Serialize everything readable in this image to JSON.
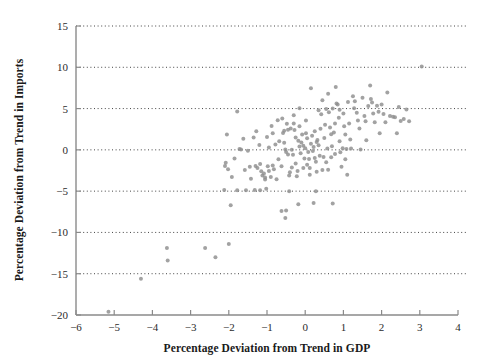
{
  "chart_data": {
    "type": "scatter",
    "title": "",
    "xlabel": "Percentage Deviation from Trend in GDP",
    "ylabel": "Percentage Deviation from Trend in Imports",
    "xlim": [
      -6,
      4
    ],
    "ylim": [
      -20,
      15
    ],
    "xticks": [
      -6,
      -5,
      -4,
      -3,
      -2,
      -1,
      0,
      1,
      2,
      3,
      4
    ],
    "xticklabels": [
      "−6",
      "−5",
      "−4",
      "−3",
      "−2",
      "−1",
      "0",
      "1",
      "2",
      "3",
      "4"
    ],
    "yticks": [
      -20,
      -15,
      -10,
      -5,
      0,
      5,
      10,
      15
    ],
    "yticklabels": [
      "−20",
      "−15",
      "−10",
      "−5",
      "0",
      "5",
      "10",
      "15"
    ],
    "grid": "horizontal-dotted",
    "legend": "none",
    "marker": {
      "shape": "circle",
      "size_px": 3.0,
      "color": "#8e8e8e"
    },
    "series": [
      {
        "name": "GDP vs Imports deviation",
        "points": [
          [
            -5.15,
            -19.6
          ],
          [
            -4.3,
            -15.6
          ],
          [
            -3.62,
            -11.9
          ],
          [
            -3.6,
            -13.4
          ],
          [
            -2.62,
            -11.9
          ],
          [
            -2.35,
            -13.0
          ],
          [
            -2.0,
            -11.4
          ],
          [
            -1.95,
            -6.7
          ],
          [
            -1.78,
            -4.9
          ],
          [
            -2.12,
            -4.85
          ],
          [
            -1.55,
            -4.9
          ],
          [
            -1.32,
            -4.85
          ],
          [
            -1.18,
            -4.9
          ],
          [
            -0.52,
            -8.25
          ],
          [
            -0.62,
            -7.4
          ],
          [
            -0.5,
            -7.35
          ],
          [
            -0.18,
            -6.6
          ],
          [
            0.22,
            -6.45
          ],
          [
            0.72,
            -6.5
          ],
          [
            0.28,
            -5.0
          ],
          [
            -0.42,
            -5.0
          ],
          [
            -1.02,
            -4.7
          ],
          [
            -2.05,
            1.85
          ],
          [
            -2.08,
            -1.55
          ],
          [
            -2.1,
            -1.95
          ],
          [
            -2.02,
            -2.35
          ],
          [
            -1.92,
            -3.3
          ],
          [
            -1.78,
            4.65
          ],
          [
            -1.72,
            0.1
          ],
          [
            -1.68,
            0.05
          ],
          [
            -1.62,
            1.35
          ],
          [
            -1.58,
            -2.45
          ],
          [
            -1.45,
            -2.05
          ],
          [
            -1.35,
            1.5
          ],
          [
            -1.3,
            -1.95
          ],
          [
            -1.28,
            2.25
          ],
          [
            -1.2,
            0.6
          ],
          [
            -1.18,
            -1.7
          ],
          [
            -1.15,
            -2.6
          ],
          [
            -1.12,
            -3.1
          ],
          [
            -1.08,
            -2.85
          ],
          [
            -1.05,
            -3.35
          ],
          [
            -1.0,
            1.55
          ],
          [
            -0.98,
            -2.0
          ],
          [
            -0.95,
            -2.55
          ],
          [
            -0.9,
            -3.3
          ],
          [
            -0.88,
            2.9
          ],
          [
            -0.85,
            -1.9
          ],
          [
            -0.82,
            -2.35
          ],
          [
            -0.78,
            0.65
          ],
          [
            -0.75,
            -3.55
          ],
          [
            -0.72,
            3.6
          ],
          [
            -0.68,
            1.05
          ],
          [
            -0.62,
            -2.0
          ],
          [
            -0.58,
            2.05
          ],
          [
            -0.55,
            2.3
          ],
          [
            -0.52,
            0.05
          ],
          [
            -0.5,
            -0.25
          ],
          [
            -0.48,
            3.15
          ],
          [
            -0.45,
            2.45
          ],
          [
            -0.42,
            -3.1
          ],
          [
            -0.4,
            -2.7
          ],
          [
            -0.38,
            2.6
          ],
          [
            -0.35,
            0.0
          ],
          [
            -0.32,
            -0.6
          ],
          [
            -0.3,
            3.2
          ],
          [
            -0.28,
            2.4
          ],
          [
            -0.25,
            -1.65
          ],
          [
            -0.22,
            -3.2
          ],
          [
            -0.2,
            -2.55
          ],
          [
            -0.18,
            1.1
          ],
          [
            -0.15,
            0.4
          ],
          [
            -0.12,
            -0.4
          ],
          [
            -0.1,
            0.9
          ],
          [
            -0.08,
            1.85
          ],
          [
            -0.05,
            0.5
          ],
          [
            -0.02,
            -1.05
          ],
          [
            0.0,
            0.2
          ],
          [
            0.02,
            2.0
          ],
          [
            0.05,
            1.4
          ],
          [
            0.08,
            -0.25
          ],
          [
            0.1,
            -1.1
          ],
          [
            0.12,
            -3.0
          ],
          [
            0.15,
            0.75
          ],
          [
            0.18,
            1.7
          ],
          [
            0.2,
            -0.15
          ],
          [
            0.22,
            0.35
          ],
          [
            0.25,
            2.25
          ],
          [
            0.28,
            -1.45
          ],
          [
            0.3,
            -2.65
          ],
          [
            0.32,
            1.2
          ],
          [
            0.35,
            0.55
          ],
          [
            0.38,
            -0.7
          ],
          [
            0.4,
            2.55
          ],
          [
            0.42,
            4.3
          ],
          [
            0.45,
            -2.45
          ],
          [
            0.48,
            -0.85
          ],
          [
            0.5,
            1.45
          ],
          [
            0.52,
            3.05
          ],
          [
            0.55,
            -1.5
          ],
          [
            0.58,
            0.15
          ],
          [
            0.6,
            -2.4
          ],
          [
            0.62,
            4.55
          ],
          [
            0.65,
            2.7
          ],
          [
            0.68,
            -0.9
          ],
          [
            0.7,
            0.45
          ],
          [
            0.72,
            5.0
          ],
          [
            0.75,
            2.1
          ],
          [
            0.78,
            -0.5
          ],
          [
            0.8,
            7.6
          ],
          [
            0.82,
            5.6
          ],
          [
            0.85,
            5.5
          ],
          [
            0.88,
            3.9
          ],
          [
            0.9,
            1.05
          ],
          [
            0.92,
            -0.3
          ],
          [
            0.95,
            -2.05
          ],
          [
            0.98,
            0.2
          ],
          [
            1.0,
            4.4
          ],
          [
            1.02,
            2.85
          ],
          [
            1.05,
            -1.15
          ],
          [
            1.08,
            0.1
          ],
          [
            1.1,
            -3.0
          ],
          [
            1.12,
            5.8
          ],
          [
            1.15,
            3.2
          ],
          [
            1.18,
            1.25
          ],
          [
            1.2,
            0.15
          ],
          [
            1.25,
            6.5
          ],
          [
            1.3,
            5.9
          ],
          [
            1.35,
            4.5
          ],
          [
            1.38,
            3.55
          ],
          [
            1.42,
            2.6
          ],
          [
            1.45,
            0.05
          ],
          [
            1.5,
            6.3
          ],
          [
            1.55,
            4.1
          ],
          [
            1.58,
            3.45
          ],
          [
            1.6,
            1.15
          ],
          [
            1.65,
            5.3
          ],
          [
            1.7,
            7.8
          ],
          [
            1.72,
            6.15
          ],
          [
            1.75,
            5.75
          ],
          [
            1.78,
            4.4
          ],
          [
            1.82,
            3.35
          ],
          [
            1.88,
            5.35
          ],
          [
            1.92,
            4.6
          ],
          [
            1.95,
            2.0
          ],
          [
            2.0,
            5.5
          ],
          [
            2.05,
            4.35
          ],
          [
            2.1,
            3.35
          ],
          [
            2.15,
            6.95
          ],
          [
            2.22,
            4.1
          ],
          [
            2.3,
            4.0
          ],
          [
            2.35,
            3.95
          ],
          [
            2.4,
            2.0
          ],
          [
            2.45,
            5.2
          ],
          [
            2.5,
            3.5
          ],
          [
            2.58,
            3.75
          ],
          [
            2.65,
            4.9
          ],
          [
            2.72,
            3.45
          ],
          [
            3.05,
            10.1
          ],
          [
            -0.6,
            3.8
          ],
          [
            -0.3,
            4.2
          ],
          [
            0.15,
            7.45
          ],
          [
            0.45,
            6.0
          ],
          [
            0.6,
            6.8
          ],
          [
            -0.15,
            5.05
          ],
          [
            0.35,
            4.8
          ],
          [
            -0.05,
            -2.2
          ],
          [
            -0.25,
            1.5
          ],
          [
            0.05,
            -1.8
          ],
          [
            -0.7,
            -1.15
          ],
          [
            -0.95,
            0.3
          ],
          [
            -1.5,
            -0.1
          ],
          [
            -1.85,
            -1.05
          ],
          [
            -1.25,
            -2.2
          ],
          [
            -0.85,
            2.0
          ],
          [
            0.68,
            1.9
          ],
          [
            1.05,
            1.85
          ],
          [
            -1.42,
            -3.5
          ],
          [
            -1.05,
            -3.6
          ],
          [
            0.12,
            -2.2
          ],
          [
            0.55,
            4.95
          ],
          [
            0.9,
            4.85
          ],
          [
            1.28,
            5.05
          ],
          [
            -0.45,
            -0.55
          ],
          [
            0.3,
            0.95
          ],
          [
            0.78,
            3.2
          ],
          [
            -0.15,
            2.85
          ],
          [
            -0.35,
            -2.15
          ],
          [
            0.25,
            -1.0
          ],
          [
            0.02,
            3.55
          ],
          [
            -0.55,
            0.85
          ]
        ]
      }
    ]
  },
  "geometry": {
    "plot_left": 76,
    "plot_right": 458,
    "plot_top": 26,
    "plot_bottom": 315
  }
}
